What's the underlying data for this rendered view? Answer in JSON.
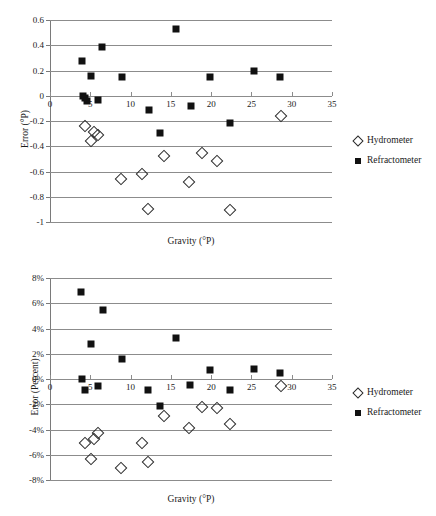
{
  "charts": [
    {
      "id": "top",
      "xlabel": "Gravity (°P)",
      "ylabel": "Error (°P)",
      "legend": {
        "hydrometer": "Hydrometer",
        "refractometer": "Refractometer"
      }
    },
    {
      "id": "bottom",
      "xlabel": "Gravity (°P)",
      "ylabel": "Error (Percent)",
      "legend": {
        "hydrometer": "Hydrometer",
        "refractometer": "Refractometer"
      }
    }
  ],
  "chart_data": [
    {
      "type": "scatter",
      "title": "",
      "xlabel": "Gravity (°P)",
      "ylabel": "Error (°P)",
      "xlim": [
        0,
        35
      ],
      "ylim": [
        -1,
        0.6
      ],
      "xticks": [
        0,
        5,
        10,
        15,
        20,
        25,
        30,
        35
      ],
      "yticks": [
        -1,
        -0.8,
        -0.6,
        -0.4,
        -0.2,
        0,
        0.2,
        0.4,
        0.6
      ],
      "xticklabels": [
        "0",
        "5",
        "10",
        "15",
        "20",
        "25",
        "30",
        "35"
      ],
      "yticklabels": [
        "-1",
        "-0.8",
        "-0.6",
        "-0.4",
        "-0.2",
        "0",
        "0.2",
        "0.4",
        "0.6"
      ],
      "grid": "horizontal",
      "legend_position": "right",
      "series": [
        {
          "name": "Refractometer",
          "marker": "filled-square",
          "color": "#111111",
          "points": [
            [
              4.0,
              0.275
            ],
            [
              4.1,
              0.0
            ],
            [
              4.3,
              -0.02
            ],
            [
              4.6,
              -0.045
            ],
            [
              5.1,
              0.155
            ],
            [
              6.0,
              -0.035
            ],
            [
              6.5,
              0.39
            ],
            [
              8.9,
              0.145
            ],
            [
              12.3,
              -0.115
            ],
            [
              13.7,
              -0.295
            ],
            [
              15.6,
              0.525
            ],
            [
              17.5,
              -0.085
            ],
            [
              19.9,
              0.145
            ],
            [
              22.4,
              -0.215
            ],
            [
              25.3,
              0.2
            ],
            [
              28.6,
              0.148
            ]
          ]
        },
        {
          "name": "Hydrometer",
          "marker": "open-diamond",
          "color": "#2a2a2a",
          "points": [
            [
              4.4,
              -0.24
            ],
            [
              5.1,
              -0.355
            ],
            [
              5.4,
              -0.29
            ],
            [
              5.9,
              -0.31
            ],
            [
              8.8,
              -0.66
            ],
            [
              11.4,
              -0.62
            ],
            [
              12.2,
              -0.9
            ],
            [
              14.2,
              -0.475
            ],
            [
              17.2,
              -0.685
            ],
            [
              18.9,
              -0.455
            ],
            [
              20.7,
              -0.515
            ],
            [
              22.3,
              -0.905
            ],
            [
              28.7,
              -0.16
            ]
          ]
        }
      ]
    },
    {
      "type": "scatter",
      "title": "",
      "xlabel": "Gravity (°P)",
      "ylabel": "Error (Percent)",
      "xlim": [
        0,
        35
      ],
      "ylim": [
        -8,
        8
      ],
      "xticks": [
        0,
        5,
        10,
        15,
        20,
        25,
        30,
        35
      ],
      "yticks": [
        -8,
        -6,
        -4,
        -2,
        0,
        2,
        4,
        6,
        8
      ],
      "xticklabels": [
        "0",
        "5",
        "10",
        "15",
        "20",
        "25",
        "30",
        "35"
      ],
      "yticklabels": [
        "-8%",
        "-6%",
        "-4%",
        "-2%",
        "0%",
        "2%",
        "4%",
        "6%",
        "8%"
      ],
      "grid": "horizontal",
      "legend_position": "right",
      "series": [
        {
          "name": "Refractometer",
          "marker": "filled-square",
          "color": "#111111",
          "points": [
            [
              3.9,
              6.9
            ],
            [
              4.0,
              0.0
            ],
            [
              4.4,
              -0.85
            ],
            [
              5.1,
              2.8
            ],
            [
              6.0,
              -0.55
            ],
            [
              6.6,
              5.45
            ],
            [
              8.9,
              1.6
            ],
            [
              12.2,
              -0.9
            ],
            [
              13.7,
              -2.1
            ],
            [
              15.6,
              3.25
            ],
            [
              17.4,
              -0.5
            ],
            [
              19.9,
              0.75
            ],
            [
              22.4,
              -0.9
            ],
            [
              25.3,
              0.8
            ],
            [
              28.6,
              0.5
            ]
          ]
        },
        {
          "name": "Hydrometer",
          "marker": "open-diamond",
          "color": "#2a2a2a",
          "points": [
            [
              4.3,
              -5.1
            ],
            [
              5.1,
              -6.35
            ],
            [
              5.4,
              -4.75
            ],
            [
              5.9,
              -4.3
            ],
            [
              8.8,
              -7.05
            ],
            [
              11.4,
              -5.05
            ],
            [
              12.2,
              -6.6
            ],
            [
              14.2,
              -2.95
            ],
            [
              17.2,
              -3.9
            ],
            [
              18.9,
              -2.25
            ],
            [
              20.7,
              -2.3
            ],
            [
              22.3,
              -3.55
            ],
            [
              28.7,
              -0.55
            ]
          ]
        }
      ]
    }
  ]
}
